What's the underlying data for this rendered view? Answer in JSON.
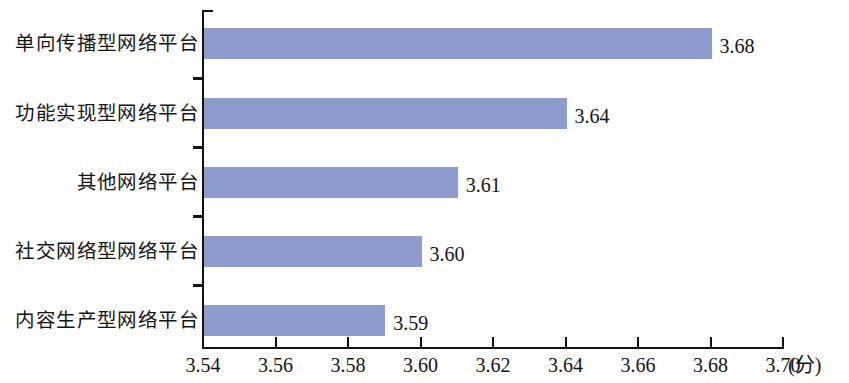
{
  "chart_data": {
    "type": "bar",
    "orientation": "horizontal",
    "title": "",
    "subtitle": "",
    "xlabel": "(分)",
    "ylabel": "",
    "categories": [
      "单向传播型网络平台",
      "功能实现型网络平台",
      "其他网络平台",
      "社交网络型网络平台",
      "内容生产型网络平台"
    ],
    "values": [
      3.68,
      3.64,
      3.61,
      3.6,
      3.59
    ],
    "value_labels": [
      "3.68",
      "3.64",
      "3.61",
      "3.60",
      "3.59"
    ],
    "xlim": [
      3.54,
      3.7
    ],
    "xticks": [
      3.54,
      3.56,
      3.58,
      3.6,
      3.62,
      3.64,
      3.66,
      3.68,
      3.7
    ],
    "xtick_labels": [
      "3.54",
      "3.56",
      "3.58",
      "3.60",
      "3.62",
      "3.64",
      "3.66",
      "3.68",
      "3.70"
    ],
    "grid": false,
    "legend": null,
    "bar_color": "#8e9ccd",
    "axis_color": "#111111",
    "background": "#ffffff"
  }
}
